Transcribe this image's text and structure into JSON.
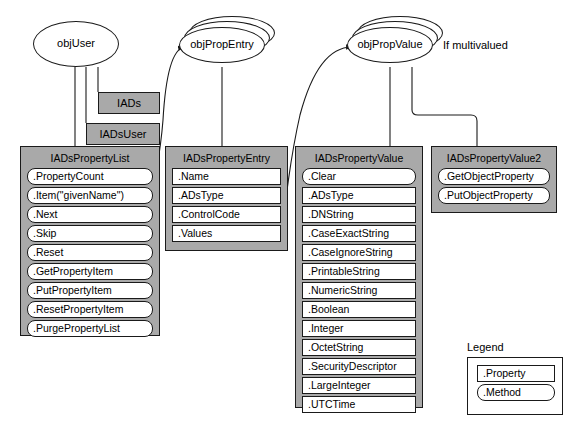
{
  "diagram": {
    "note_multivalued": "If multivalued",
    "colors": {
      "box_fill": "#a9a9a9",
      "member_fill": "#ffffff",
      "stroke": "#1a1a1a",
      "background": "#ffffff"
    }
  },
  "objects": [
    {
      "id": "objUser",
      "label": "objUser",
      "stacked": false
    },
    {
      "id": "objPropEntry",
      "label": "objPropEntry",
      "stacked": true
    },
    {
      "id": "objPropValue",
      "label": "objPropValue",
      "stacked": true
    }
  ],
  "plain_boxes": [
    {
      "id": "iads",
      "label": "IADs"
    },
    {
      "id": "iadsuser",
      "label": "IADsUser"
    }
  ],
  "interfaces": [
    {
      "id": "iadspropertylist",
      "title": "IADsPropertyList",
      "members": [
        {
          "label": ".PropertyCount",
          "kind": "method"
        },
        {
          "label": ".Item(\"givenName\")",
          "kind": "method"
        },
        {
          "label": ".Next",
          "kind": "method"
        },
        {
          "label": ".Skip",
          "kind": "method"
        },
        {
          "label": ".Reset",
          "kind": "method"
        },
        {
          "label": ".GetPropertyItem",
          "kind": "method"
        },
        {
          "label": ".PutPropertyItem",
          "kind": "method"
        },
        {
          "label": ".ResetPropertyItem",
          "kind": "method"
        },
        {
          "label": ".PurgePropertyList",
          "kind": "method"
        }
      ]
    },
    {
      "id": "iadspropertyentry",
      "title": "IADsPropertyEntry",
      "members": [
        {
          "label": ".Name",
          "kind": "property"
        },
        {
          "label": ".ADsType",
          "kind": "property"
        },
        {
          "label": ".ControlCode",
          "kind": "property"
        },
        {
          "label": ".Values",
          "kind": "property"
        }
      ]
    },
    {
      "id": "iadspropertyvalue",
      "title": "IADsPropertyValue",
      "members": [
        {
          "label": ".Clear",
          "kind": "method"
        },
        {
          "label": ".ADsType",
          "kind": "property"
        },
        {
          "label": ".DNString",
          "kind": "property"
        },
        {
          "label": ".CaseExactString",
          "kind": "property"
        },
        {
          "label": ".CaseIgnoreString",
          "kind": "property"
        },
        {
          "label": ".PrintableString",
          "kind": "property"
        },
        {
          "label": ".NumericString",
          "kind": "property"
        },
        {
          "label": ".Boolean",
          "kind": "property"
        },
        {
          "label": ".Integer",
          "kind": "property"
        },
        {
          "label": ".OctetString",
          "kind": "property"
        },
        {
          "label": ".SecurityDescriptor",
          "kind": "property"
        },
        {
          "label": ".LargeInteger",
          "kind": "property"
        },
        {
          "label": ".UTCTime",
          "kind": "property"
        }
      ]
    },
    {
      "id": "iadspropertyvalue2",
      "title": "IADsPropertyValue2",
      "members": [
        {
          "label": ".GetObjectProperty",
          "kind": "method"
        },
        {
          "label": ".PutObjectProperty",
          "kind": "method"
        }
      ]
    }
  ],
  "legend": {
    "title": "Legend",
    "items": [
      {
        "label": ".Property",
        "kind": "property"
      },
      {
        "label": ".Method",
        "kind": "method"
      }
    ]
  }
}
